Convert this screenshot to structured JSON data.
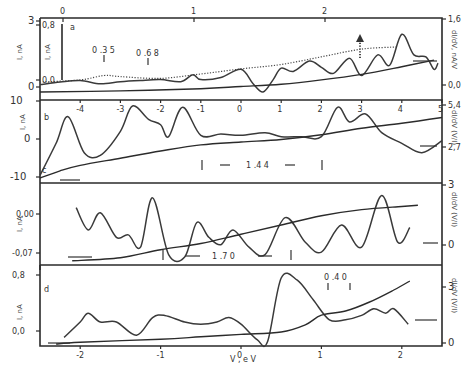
{
  "chart_data": [
    {
      "panel": "a",
      "type": "line",
      "label": "a",
      "x_top": {
        "ticks": [
          0,
          1,
          2
        ],
        "range": [
          -0.3,
          2.5
        ]
      },
      "x_bottom": {
        "ticks": [
          -4,
          -3,
          -2,
          -1,
          0,
          1,
          2,
          3,
          4,
          5
        ],
        "range": [
          -5,
          5
        ]
      },
      "y_left": {
        "label": "I, nA",
        "ticks": [
          "3",
          "0"
        ],
        "range": [
          0,
          3
        ]
      },
      "y_inner": {
        "label": "I, nA",
        "ticks": [
          "0,8",
          "0,0"
        ],
        "range": [
          0,
          0.8
        ]
      },
      "y_right": {
        "label": "dI/dV, nA/V",
        "ticks": [
          "1,6",
          "0,0"
        ],
        "range": [
          0,
          1.6
        ]
      },
      "annotations": [
        "0.35",
        "0.68"
      ],
      "series": [
        {
          "name": "I(V) upper",
          "x": [
            -5,
            -4,
            -3.4,
            -3,
            -2,
            -1,
            0,
            1,
            2,
            3,
            3.9
          ],
          "y": [
            0.45,
            0.55,
            0.75,
            0.7,
            0.62,
            0.82,
            1.05,
            1.25,
            1.6,
            1.95,
            2.05
          ]
        },
        {
          "name": "dI/dV",
          "x": [
            -5,
            -4.5,
            -4,
            -3.5,
            -3,
            -2.5,
            -2,
            -1.5,
            -1.2,
            -1,
            -0.5,
            0,
            0.3,
            0.55,
            0.8,
            1,
            1.3,
            1.7,
            2,
            2.3,
            2.7,
            3,
            3.4,
            3.7,
            4,
            4.3,
            4.6,
            4.8,
            4.9
          ],
          "y": [
            0.18,
            0.24,
            0.28,
            0.2,
            0.25,
            0.28,
            0.3,
            0.25,
            0.42,
            0.3,
            0.35,
            0.55,
            0.2,
            0.0,
            0.3,
            0.58,
            0.5,
            0.75,
            0.6,
            0.45,
            0.82,
            0.4,
            0.9,
            0.65,
            1.4,
            0.9,
            0.85,
            0.55,
            0.7
          ]
        },
        {
          "name": "I(V) lower",
          "x": [
            -5,
            -3,
            -1,
            0,
            1,
            2,
            3,
            4,
            4.8
          ],
          "y": [
            0.0,
            0.05,
            0.15,
            0.25,
            0.35,
            0.55,
            0.8,
            1.15,
            1.45
          ]
        }
      ]
    },
    {
      "panel": "b",
      "type": "line",
      "label": "b",
      "x_bottom": {
        "ticks": [
          -4,
          -3,
          -2,
          -1,
          0,
          1,
          2,
          3,
          4,
          5
        ],
        "range": [
          -5,
          5
        ]
      },
      "y_left": {
        "label": "I, nA",
        "ticks": [
          "10",
          "0",
          "-10"
        ],
        "range": [
          -10,
          10
        ]
      },
      "y_right": {
        "label": "dI/dV (V/I)",
        "ticks": [
          "5,4",
          "2,7"
        ],
        "range": [
          0,
          5.4
        ]
      },
      "annotations": [
        "1.44"
      ],
      "series": [
        {
          "name": "dI/dV",
          "x": [
            -5,
            -4.6,
            -4.3,
            -3.9,
            -3.5,
            -3.0,
            -2.7,
            -2.3,
            -2.0,
            -1.8,
            -1.45,
            -1.0,
            -0.5,
            0,
            0.6,
            1.0,
            1.5,
            2.0,
            2.4,
            2.7,
            3.1,
            3.5,
            4.0,
            4.5,
            5.0
          ],
          "y": [
            0.2,
            2.6,
            4.6,
            1.9,
            1.7,
            3.5,
            5.4,
            4.4,
            4.0,
            3.1,
            5.3,
            3.2,
            3.3,
            3.2,
            3.4,
            3.1,
            3.1,
            3.1,
            5.3,
            4.2,
            4.8,
            3.4,
            2.6,
            1.9,
            2.8
          ]
        },
        {
          "name": "I(V)",
          "x": [
            -5,
            -4.5,
            -4,
            -3,
            -2,
            -1,
            0,
            1,
            2,
            3,
            4,
            5
          ],
          "y": [
            -10,
            -8,
            -6.5,
            -4.5,
            -2.5,
            -0.8,
            0,
            0.7,
            2,
            3.8,
            5.2,
            6.8
          ]
        }
      ]
    },
    {
      "panel": "c",
      "type": "line",
      "label": "c",
      "x_bottom": {
        "ticks": [
          -2,
          -1,
          0,
          1,
          2
        ],
        "range": [
          -2.5,
          2.5
        ]
      },
      "y_left": {
        "label": "I, nA",
        "ticks": [
          "0,00",
          "-0,07"
        ],
        "range": [
          -0.07,
          0.05
        ]
      },
      "y_right": {
        "label": "dI/dV (V/I)",
        "ticks": [
          "3",
          "0"
        ],
        "range": [
          0,
          3
        ]
      },
      "annotations": [
        "1.70"
      ],
      "series": [
        {
          "name": "dI/dV",
          "x": [
            -2.05,
            -1.9,
            -1.75,
            -1.55,
            -1.4,
            -1.25,
            -1.1,
            -0.9,
            -0.7,
            -0.55,
            -0.4,
            -0.25,
            -0.1,
            0.1,
            0.3,
            0.55,
            0.8,
            1.0,
            1.25,
            1.5,
            1.75,
            1.95,
            2.1
          ],
          "y": [
            2.2,
            1.3,
            2.0,
            1.0,
            1.1,
            0.6,
            2.6,
            0.3,
            0.2,
            1.6,
            1.0,
            0.7,
            1.3,
            0.6,
            0.3,
            1.8,
            0.8,
            0.4,
            1.5,
            0.6,
            2.7,
            0.8,
            1.4
          ]
        },
        {
          "name": "I(V)",
          "x": [
            -2.1,
            -1.5,
            -1.0,
            -0.5,
            0,
            0.5,
            1.0,
            1.5,
            2.0,
            2.2
          ],
          "y": [
            -0.068,
            -0.063,
            -0.05,
            -0.04,
            -0.025,
            -0.01,
            0.005,
            0.015,
            0.02,
            0.022
          ]
        }
      ]
    },
    {
      "panel": "d",
      "type": "line",
      "label": "d",
      "xlabel": "V, eV",
      "x_bottom": {
        "ticks": [
          -2,
          -1,
          0,
          1,
          2
        ],
        "range": [
          -2.5,
          2.5
        ]
      },
      "y_left": {
        "label": "I, nA",
        "ticks": [
          "0,8",
          "0,0"
        ],
        "range": [
          -0.2,
          0.9
        ]
      },
      "y_right": {
        "label": "dI/dV (V/I)",
        "ticks": [
          "3",
          "0"
        ],
        "range": [
          0,
          3
        ]
      },
      "annotations": [
        "0.40"
      ],
      "series": [
        {
          "name": "dI/dV",
          "x": [
            -2.2,
            -2.0,
            -1.9,
            -1.75,
            -1.55,
            -1.3,
            -1.1,
            -0.95,
            -0.7,
            -0.5,
            -0.3,
            -0.15,
            0,
            0.2,
            0.33,
            0.5,
            0.7,
            0.9,
            1.1,
            1.3,
            1.5,
            1.65,
            1.8,
            1.9,
            2.08
          ],
          "y": [
            0.3,
            1.0,
            1.4,
            1.0,
            1.0,
            0.4,
            1.2,
            1.3,
            1.0,
            0.9,
            1.0,
            1.2,
            0.9,
            0.2,
            0.1,
            3.0,
            2.9,
            2.0,
            1.1,
            1.1,
            1.3,
            1.6,
            1.4,
            1.6,
            0.9
          ]
        },
        {
          "name": "I(V)",
          "x": [
            -2.3,
            -2.0,
            -1.0,
            -0.5,
            0,
            0.5,
            0.8,
            1.0,
            1.3,
            1.6,
            1.9,
            2.1
          ],
          "y": [
            -0.2,
            -0.17,
            -0.12,
            -0.08,
            -0.04,
            0.0,
            0.12,
            0.28,
            0.35,
            0.5,
            0.7,
            0.85
          ]
        }
      ]
    }
  ],
  "labels": {
    "panel_a": "a",
    "panel_b": "b",
    "panel_c": "c",
    "panel_d": "d",
    "ylab_left": "I, nA",
    "ylab_right_a": "dI/dV, nA/V",
    "ylab_right_bcd": "dI/dV (V/I)",
    "xlab": "V , e V",
    "ann_035": "0 .3 5",
    "ann_068": "0 .6 8",
    "ann_144": "1 .4 4",
    "ann_170": "1 .7 0",
    "ann_040": "0 .4 0"
  }
}
